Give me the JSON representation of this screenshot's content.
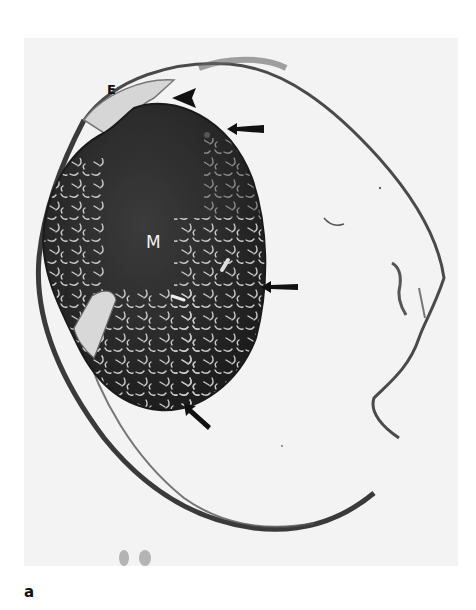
{
  "figure": {
    "panel_label": "a",
    "image_description": "Histological section of an eye showing a large dark-staining intraocular mass with reticulated white pattern, detached retina/choroid membranes and annotations",
    "labels": {
      "E_upper": "E",
      "M": "M",
      "E_lower": "E"
    },
    "annotations": [
      {
        "type": "arrowhead",
        "direction": "left",
        "position": "top, near upper E"
      },
      {
        "type": "arrow",
        "direction": "left",
        "position": "upper right edge of mass"
      },
      {
        "type": "arrow",
        "direction": "left",
        "position": "mid right edge of mass"
      },
      {
        "type": "arrow",
        "direction": "up-left",
        "position": "bottom edge of mass"
      }
    ],
    "colors": {
      "background": "#ffffff",
      "photo_background": "#f3f3f3",
      "mass_dark": "#2a2a2a",
      "mass_mid": "#3a3a3a",
      "tissue_line": "#444444",
      "marker": "#111111"
    }
  }
}
